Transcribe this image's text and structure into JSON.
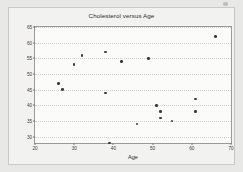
{
  "chart_data": {
    "type": "scatter",
    "title": "Cholesterol versus Age",
    "xlabel": "Age",
    "ylabel": "cholesterol",
    "xlim": [
      20,
      70
    ],
    "ylim": [
      28,
      65
    ],
    "xticks": [
      20,
      30,
      40,
      50,
      60,
      70
    ],
    "yticks": [
      30,
      35,
      40,
      45,
      50,
      55,
      60,
      65
    ],
    "grid": true,
    "legend": "none",
    "marker_color": "#3a3a3a",
    "x": [
      26,
      27,
      30,
      32,
      38,
      38,
      39,
      42,
      46,
      49,
      51,
      52,
      52,
      55,
      61,
      61,
      66
    ],
    "y": [
      47,
      45,
      53,
      56,
      57,
      44,
      28,
      54,
      34,
      55,
      40,
      38,
      36,
      35,
      42,
      38,
      62
    ],
    "points": [
      {
        "age": 26,
        "cholesterol": 47
      },
      {
        "age": 27,
        "cholesterol": 45
      },
      {
        "age": 30,
        "cholesterol": 53
      },
      {
        "age": 32,
        "cholesterol": 56
      },
      {
        "age": 38,
        "cholesterol": 57
      },
      {
        "age": 38,
        "cholesterol": 44
      },
      {
        "age": 39,
        "cholesterol": 28
      },
      {
        "age": 42,
        "cholesterol": 54
      },
      {
        "age": 46,
        "cholesterol": 34
      },
      {
        "age": 49,
        "cholesterol": 55
      },
      {
        "age": 51,
        "cholesterol": 40
      },
      {
        "age": 52,
        "cholesterol": 38
      },
      {
        "age": 52,
        "cholesterol": 36
      },
      {
        "age": 55,
        "cholesterol": 35
      },
      {
        "age": 61,
        "cholesterol": 42
      },
      {
        "age": 61,
        "cholesterol": 38
      },
      {
        "age": 66,
        "cholesterol": 62
      }
    ]
  }
}
